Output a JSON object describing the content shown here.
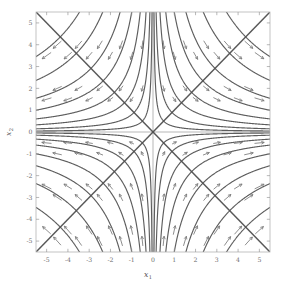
{
  "figure": {
    "type": "phase-portrait",
    "background_color": "#ffffff",
    "frame_color": "#b4b4b4",
    "axis_line_color": "#9a9a9a",
    "streamline_color": "#4f4f4f",
    "arrow_color": "#7a7a7a"
  },
  "axes": {
    "x": {
      "label": "x",
      "label_sub": "1",
      "min": -5.5,
      "max": 5.5,
      "ticks": [
        -5,
        -4,
        -3,
        -2,
        -1,
        0,
        1,
        2,
        3,
        4,
        5
      ],
      "tick_labels": [
        "-5",
        "-4",
        "-3",
        "-2",
        "-1",
        "0",
        "1",
        "2",
        "3",
        "4",
        "5"
      ]
    },
    "y": {
      "label": "x",
      "label_sub": "2",
      "min": -5.5,
      "max": 5.5,
      "ticks": [
        -5,
        -4,
        -3,
        -2,
        -1,
        0,
        1,
        2,
        3,
        4,
        5
      ],
      "tick_labels": [
        "-5",
        "-4",
        "-3",
        "-2",
        "-1",
        "0",
        "1",
        "2",
        "3",
        "4",
        "5"
      ]
    }
  },
  "chart_data": {
    "type": "line",
    "title": "",
    "subtitle": "",
    "xlabel": "x1",
    "ylabel": "x2",
    "xlim": [
      -5.5,
      5.5
    ],
    "ylim": [
      -5.5,
      5.5
    ],
    "grid": false,
    "legend": null,
    "plot_kind": "streamplot_saddle",
    "system": {
      "description": "Linear saddle: dx1/dt = x1, dx2/dt = -x2",
      "fixed_point": [
        0,
        0
      ],
      "fixed_point_kind": "saddle",
      "eigenvalues": [
        1,
        -1
      ],
      "eigenvectors": [
        [
          1,
          0
        ],
        [
          0,
          1
        ]
      ]
    },
    "separatrices": [
      {
        "name": "unstable-diagonal",
        "from": [
          -5.5,
          -5.5
        ],
        "to": [
          5.5,
          5.5
        ],
        "direction": "outward"
      },
      {
        "name": "stable-antidiagonal",
        "from": [
          -5.5,
          5.5
        ],
        "to": [
          5.5,
          -5.5
        ],
        "direction": "inward"
      }
    ],
    "streamline_constants": [
      0.25,
      0.8,
      1.8,
      3.3,
      5.5,
      8.5,
      13.0,
      19.0
    ],
    "quadrant_flow": [
      {
        "quadrant": "upper-left",
        "arrow_direction": "down-right"
      },
      {
        "quadrant": "upper-right",
        "arrow_direction": "up-right"
      },
      {
        "quadrant": "lower-left",
        "arrow_direction": "down-left"
      },
      {
        "quadrant": "lower-right",
        "arrow_direction": "up-right"
      }
    ],
    "arrow_count": 96
  }
}
